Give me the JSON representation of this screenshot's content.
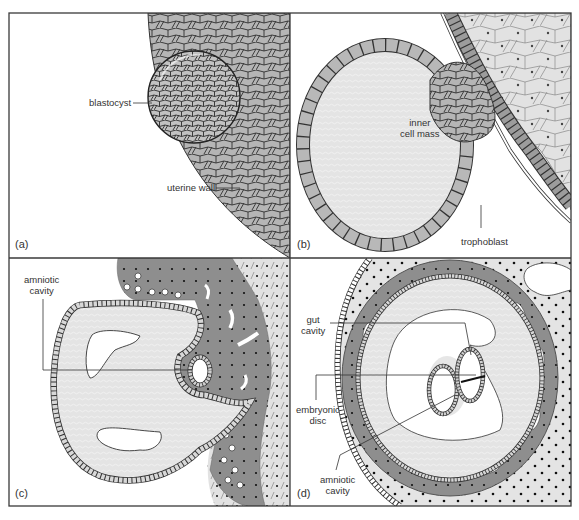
{
  "figure": {
    "panels": [
      {
        "id": "a",
        "panel_label": "(a)",
        "labels": {
          "blastocyst": "blastocyst",
          "uterine_wall": "uterine wall"
        }
      },
      {
        "id": "b",
        "panel_label": "(b)",
        "labels": {
          "inner_cell_mass_1": "inner",
          "inner_cell_mass_2": "cell mass",
          "trophoblast": "trophoblast"
        }
      },
      {
        "id": "c",
        "panel_label": "(c)",
        "labels": {
          "amniotic_cavity_1": "amniotic",
          "amniotic_cavity_2": "cavity"
        }
      },
      {
        "id": "d",
        "panel_label": "(d)",
        "labels": {
          "gut_cavity_1": "gut",
          "gut_cavity_2": "cavity",
          "embryonic_disc_1": "embryonic",
          "embryonic_disc_2": "disc",
          "amniotic_cavity_1": "amniotic",
          "amniotic_cavity_2": "cavity"
        }
      }
    ],
    "colors": {
      "frame": "#3a3a3a",
      "cell_fill": "#b8b8b8",
      "cell_fill_dark": "#9a9a9a",
      "cavity_fill": "#e6e6e6",
      "tissue_dark": "#8c8c8c",
      "tissue_light": "#dcdcdc",
      "line": "#2a2a2a"
    }
  }
}
